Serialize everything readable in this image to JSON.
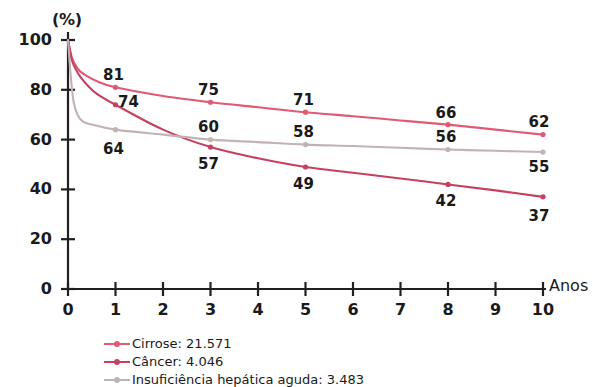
{
  "chart_data": {
    "type": "line",
    "title": "",
    "subtitle": "",
    "xlabel": "Anos",
    "ylabel": "(%)",
    "xlim": [
      0,
      10
    ],
    "ylim": [
      0,
      100
    ],
    "grid": false,
    "legend_position": "bottom-left",
    "x_ticks": [
      "0",
      "1",
      "2",
      "3",
      "4",
      "5",
      "6",
      "7",
      "8",
      "9",
      "10"
    ],
    "y_ticks": [
      "0",
      "20",
      "40",
      "60",
      "80",
      "100"
    ],
    "labeled_x": [
      1,
      3,
      5,
      8,
      10
    ],
    "series": [
      {
        "name": "Cirrose: 21.571",
        "legend_label": "Cirrose: 21.571",
        "color": "#e05a73",
        "x": [
          0,
          0.08,
          0.17,
          0.25,
          0.4,
          0.6,
          1,
          2,
          3,
          4,
          5,
          6,
          7,
          8,
          9,
          10
        ],
        "values": [
          100,
          93,
          89.5,
          87.5,
          85.5,
          83.5,
          81,
          77.5,
          75,
          73,
          71,
          69.4,
          67.7,
          66,
          64,
          62
        ],
        "point_labels": [
          {
            "x": 1,
            "y": 81,
            "text": "81"
          },
          {
            "x": 3,
            "y": 75,
            "text": "75"
          },
          {
            "x": 5,
            "y": 71,
            "text": "71"
          },
          {
            "x": 8,
            "y": 66,
            "text": "66"
          },
          {
            "x": 10,
            "y": 62,
            "text": "62"
          }
        ]
      },
      {
        "name": "Câncer: 4.046",
        "legend_label": "Câncer: 4.046",
        "color": "#c6405f",
        "x": [
          0,
          0.08,
          0.17,
          0.25,
          0.4,
          0.6,
          1,
          2,
          3,
          4,
          5,
          6,
          7,
          8,
          9,
          10
        ],
        "values": [
          100,
          92,
          88,
          85.5,
          82,
          78.5,
          74,
          64,
          57,
          52.5,
          49,
          46.7,
          44.4,
          42,
          39.6,
          37
        ],
        "point_labels": [
          {
            "x": 1,
            "y": 74,
            "text": "74"
          },
          {
            "x": 3,
            "y": 57,
            "text": "57"
          },
          {
            "x": 5,
            "y": 49,
            "text": "49"
          },
          {
            "x": 8,
            "y": 42,
            "text": "42"
          },
          {
            "x": 10,
            "y": 37,
            "text": "37"
          }
        ]
      },
      {
        "name": "Insuficiência hepática aguda: 3.483",
        "legend_label": "Insuficiência hepática aguda: 3.483",
        "color": "#c3b2b4",
        "x": [
          0,
          0.06,
          0.12,
          0.2,
          0.3,
          0.45,
          1,
          2,
          3,
          4,
          5,
          6,
          7,
          8,
          9,
          10
        ],
        "values": [
          100,
          85,
          75,
          70,
          67.5,
          66.3,
          64,
          62,
          60,
          59,
          58,
          57.4,
          56.7,
          56,
          55.5,
          55
        ],
        "point_labels": [
          {
            "x": 1,
            "y": 64,
            "text": "64"
          },
          {
            "x": 3,
            "y": 60,
            "text": "60"
          },
          {
            "x": 5,
            "y": 58,
            "text": "58"
          },
          {
            "x": 8,
            "y": 56,
            "text": "56"
          },
          {
            "x": 10,
            "y": 55,
            "text": "55"
          }
        ]
      }
    ]
  },
  "axis": {
    "y_unit": "(%)",
    "x_title": "Anos"
  }
}
